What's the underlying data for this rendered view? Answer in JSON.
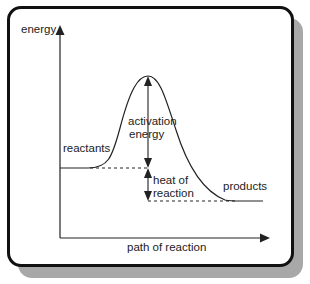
{
  "diagram": {
    "y_axis_label": "energy",
    "x_axis_label": "path of reaction",
    "labels": {
      "reactants": "reactants",
      "products": "products",
      "activation_line1": "activation",
      "activation_line2": "energy",
      "heat_line1": "heat of",
      "heat_line2": "reaction"
    },
    "colors": {
      "line": "#222222",
      "frame": "#111111",
      "shadow": "#a8a8a8",
      "background": "#ffffff"
    },
    "levels": {
      "reactants_y": 168,
      "peak_y": 76,
      "products_y": 201
    }
  }
}
